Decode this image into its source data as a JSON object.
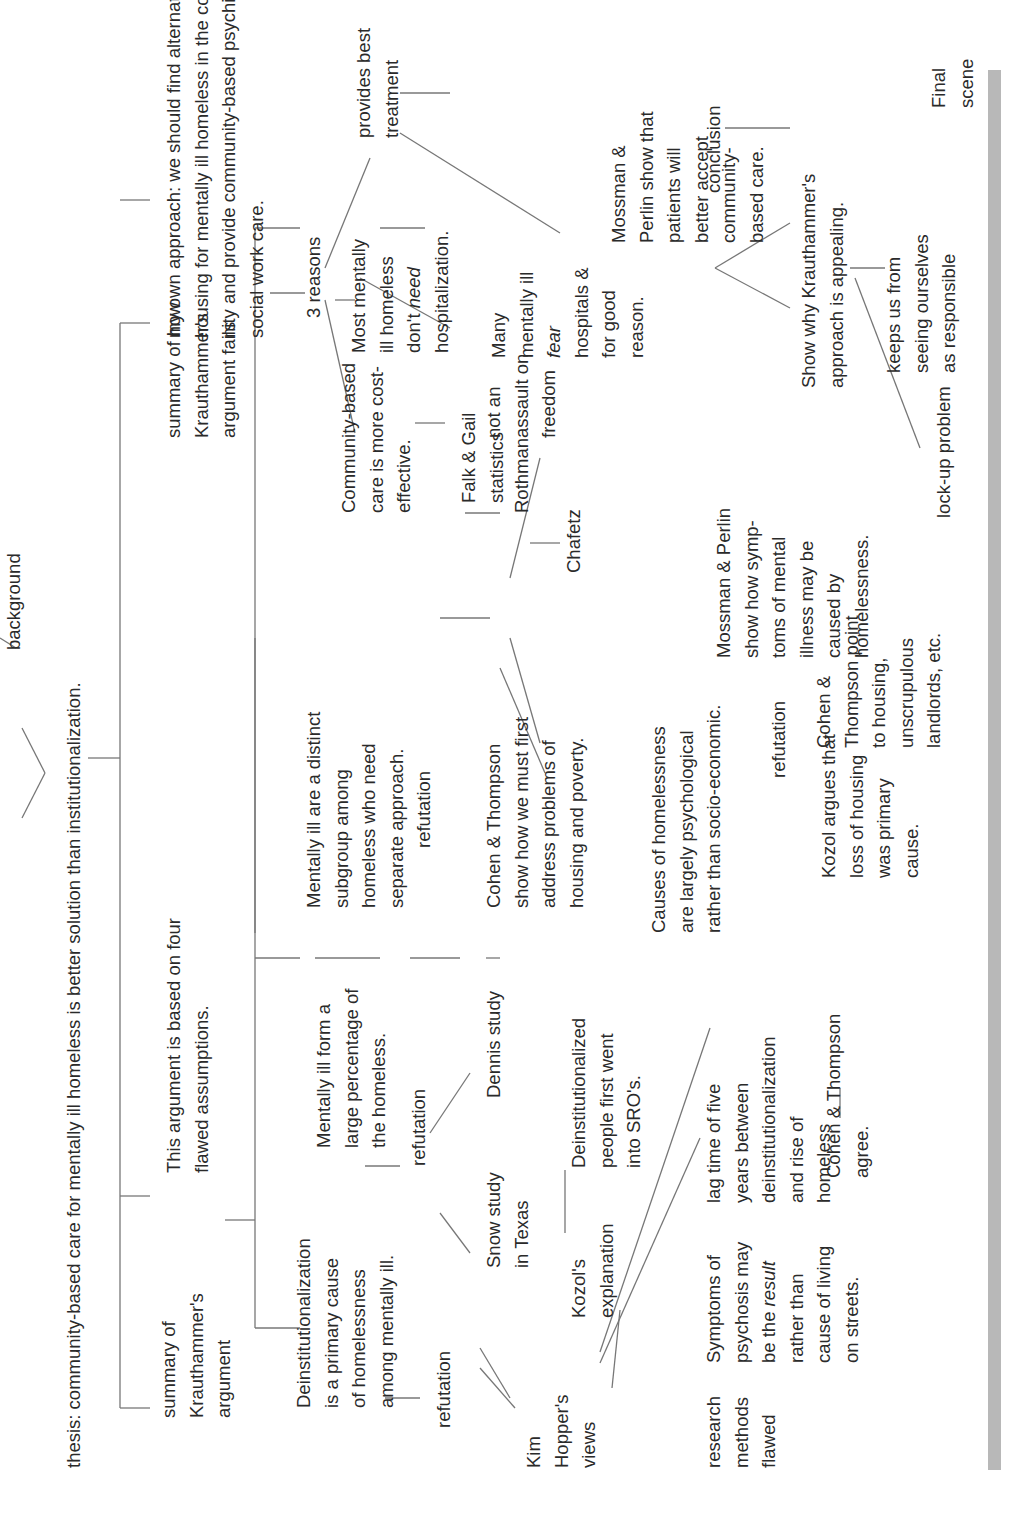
{
  "diagram": {
    "thesis": "thesis: community-based care for mentally ill homeless is better solution than institutionalization.",
    "background": "background",
    "sections": {
      "summary": "summary of\nKrauthammer's\nargument",
      "flawed": "This argument is based on four\nflawed assumptions.",
      "fails": "summary of how\nKrauthammer's\nargument fails",
      "own_approach": "my own approach: we should find alternative\nhousing for mentally ill homeless in the commu-\nnity and provide community-based psychiatric &\nsocial work care."
    },
    "assumptions": {
      "a1": "Deinstitutionalization\nis a primary cause\nof homelessness\namong mentally ill.",
      "a1_refutation": "refutation",
      "a1_hopper": "Kim\nHopper's\nviews",
      "a1_kozol": "Kozol's\nexplanation",
      "a1_kozol_detail": "Deinstitutionalized\npeople first went\ninto SRO's.",
      "a1_research": "research\nmethods\nflawed",
      "a1_symptoms_pre": "Symptoms of\npsychosis may\nbe the ",
      "a1_symptoms_em": "result",
      "a1_symptoms_post": "\nrather than\ncause of living\non streets.",
      "a1_lag": "lag time of five\nyears between\ndeinstitutionalization\nand rise of\nhomeless",
      "a1_cohen_agree": "Cohen & Thompson\nagree.",
      "a2": "Mentally ill form a\nlarge percentage of\nthe homeless.",
      "a2_refutation": "refutation",
      "a2_snow": "Snow study\nin Texas",
      "a2_dennis": "Dennis study",
      "a3": "Mentally ill are a distinct\nsubgroup among\nhomeless who need\nseparate approach.",
      "a3_refutation": "refutation",
      "a3_cohen": "Cohen & Thompson\nshow how we must first\naddress problems of\nhousing and poverty.",
      "a4": "Causes of homelessness\nare largely psychological\nrather than socio-economic.",
      "a4_refutation": "refutation",
      "a4_kozol": "Kozol argues that\nloss of housing\nwas primary\ncause.",
      "a4_cohen": "Cohen &\nThompson point\nto housing,\nunscrupulous\nlandlords, etc.",
      "a4_mossman": "Mossman & Perlin\nshow how symp-\ntoms of mental\nillness may be\ncaused by\nhomelessness."
    },
    "reasons": {
      "label": "3 reasons",
      "r1": "Community-based\ncare is more cost-\neffective.",
      "r1_falk": "Falk & Gail\nstatistics",
      "r1_rothman": "Rothman",
      "r1_chafetz": "Chafetz",
      "r2_pre": "Most mentally\nill homeless\ndon't ",
      "r2_em": "need",
      "r2_post": "\nhospitalization.",
      "r2_freedom": "not an\nassault on\nfreedom",
      "r3": "provides best\ntreatment",
      "r3_many_a": "Many\nmentally ill\n",
      "r3_many_em": "fear",
      "r3_many_b": "\nhospitals &\nfor good\nreason.",
      "r3_mossman": "Mossman &\nPerlin show that\npatients will\nbetter accept\ncommunity-\nbased care."
    },
    "conclusion": {
      "label": "conclusion",
      "show_why": "Show why Krauthammer's\napproach is appealing.",
      "lockup": "lock-up problem",
      "keeps": "keeps us from\nseeing ourselves\nas responsible",
      "final": "Final\nscene"
    }
  }
}
